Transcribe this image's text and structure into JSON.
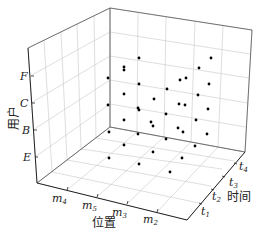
{
  "chart_data": {
    "type": "scatter3d",
    "title": "",
    "axes": {
      "x": {
        "label": "位置",
        "ticks": [
          {
            "base": "m",
            "sub": "4"
          },
          {
            "base": "m",
            "sub": "5"
          },
          {
            "base": "m",
            "sub": "3"
          },
          {
            "base": "m",
            "sub": "2"
          }
        ]
      },
      "y": {
        "label": "时间",
        "ticks": [
          {
            "base": "t",
            "sub": "1"
          },
          {
            "base": "t",
            "sub": "2"
          },
          {
            "base": "t",
            "sub": "3"
          },
          {
            "base": "t",
            "sub": "4"
          }
        ]
      },
      "z": {
        "label": "用户",
        "ticks": [
          "E",
          "B",
          "C",
          "F"
        ]
      }
    },
    "grid": true,
    "legend": null,
    "points_screen": [
      [
        139,
        58
      ],
      [
        211,
        58
      ],
      [
        124,
        67
      ],
      [
        124,
        70
      ],
      [
        199,
        68
      ],
      [
        108,
        78
      ],
      [
        180,
        80
      ],
      [
        186,
        78
      ],
      [
        139,
        84
      ],
      [
        209,
        84
      ],
      [
        167,
        89
      ],
      [
        124,
        94
      ],
      [
        198,
        95
      ],
      [
        154,
        99
      ],
      [
        108,
        105
      ],
      [
        138,
        108
      ],
      [
        139,
        110
      ],
      [
        179,
        104
      ],
      [
        185,
        105
      ],
      [
        208,
        109
      ],
      [
        166,
        114
      ],
      [
        124,
        120
      ],
      [
        151,
        122
      ],
      [
        153,
        126
      ],
      [
        196,
        120
      ],
      [
        178,
        128
      ],
      [
        183,
        132
      ],
      [
        207,
        134
      ],
      [
        109,
        132
      ],
      [
        138,
        134
      ],
      [
        166,
        139
      ],
      [
        195,
        146
      ],
      [
        124,
        145
      ],
      [
        153,
        152
      ],
      [
        182,
        158
      ],
      [
        109,
        158
      ],
      [
        139,
        164
      ],
      [
        170,
        172
      ]
    ]
  },
  "labels": {
    "z_axis": "用户",
    "x_axis": "位置",
    "y_axis": "时间",
    "z_ticks": [
      "F",
      "C",
      "B",
      "E"
    ],
    "x_ticks": [
      "m",
      "m",
      "m",
      "m"
    ],
    "x_subs": [
      "4",
      "5",
      "3",
      "2"
    ],
    "y_ticks": [
      "t",
      "t",
      "t",
      "t"
    ],
    "y_subs": [
      "1",
      "2",
      "3",
      "4"
    ]
  }
}
